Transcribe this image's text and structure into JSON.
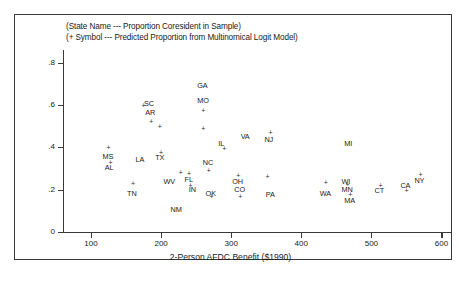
{
  "figure": {
    "caption_line1": "(State Name --- Proportion Coresident in Sample)",
    "caption_line2": "(+ Symbol --- Predicted Proportion from Multinomical Logit Model)"
  },
  "chart_data": {
    "type": "scatter",
    "title": "",
    "xlabel": "2-Person AFDC Benefit ($1990)",
    "ylabel": "",
    "xlim": [
      60,
      615
    ],
    "ylim": [
      0,
      0.86
    ],
    "grid": false,
    "legend": "none",
    "xticks": [
      100,
      200,
      300,
      400,
      500,
      600
    ],
    "xtick_labels": [
      "100",
      "200",
      "300",
      "400",
      "500",
      "600"
    ],
    "yticks": [
      0,
      0.2,
      0.4,
      0.6,
      0.8
    ],
    "ytick_labels": [
      "0",
      ".2",
      ".4",
      ".6",
      ".8"
    ],
    "series": [
      {
        "name": "Proportion Coresident in Sample",
        "marker": "state-name-label",
        "points": [
          {
            "label": "GA",
            "x": 260,
            "y": 0.695
          },
          {
            "label": "MO",
            "x": 260,
            "y": 0.625
          },
          {
            "label": "SC",
            "x": 184,
            "y": 0.61
          },
          {
            "label": "AR",
            "x": 186,
            "y": 0.565
          },
          {
            "label": "VA",
            "x": 322,
            "y": 0.455
          },
          {
            "label": "NJ",
            "x": 356,
            "y": 0.44
          },
          {
            "label": "IL",
            "x": 290,
            "y": 0.42
          },
          {
            "label": "MI",
            "x": 470,
            "y": 0.42
          },
          {
            "label": "MS",
            "x": 125,
            "y": 0.36
          },
          {
            "label": "AL",
            "x": 128,
            "y": 0.305
          },
          {
            "label": "TX",
            "x": 200,
            "y": 0.355
          },
          {
            "label": "LA",
            "x": 172,
            "y": 0.345
          },
          {
            "label": "NC",
            "x": 268,
            "y": 0.33
          },
          {
            "label": "FL",
            "x": 242,
            "y": 0.252
          },
          {
            "label": "WV",
            "x": 212,
            "y": 0.24
          },
          {
            "label": "IN",
            "x": 248,
            "y": 0.205
          },
          {
            "label": "OH",
            "x": 310,
            "y": 0.242
          },
          {
            "label": "CO",
            "x": 313,
            "y": 0.205
          },
          {
            "label": "OK",
            "x": 272,
            "y": 0.185
          },
          {
            "label": "TN",
            "x": 160,
            "y": 0.185
          },
          {
            "label": "NM",
            "x": 222,
            "y": 0.11
          },
          {
            "label": "PA",
            "x": 358,
            "y": 0.18
          },
          {
            "label": "WA",
            "x": 435,
            "y": 0.185
          },
          {
            "label": "WI",
            "x": 466,
            "y": 0.24
          },
          {
            "label": "MN",
            "x": 466,
            "y": 0.205
          },
          {
            "label": "MA",
            "x": 470,
            "y": 0.15
          },
          {
            "label": "CT",
            "x": 513,
            "y": 0.2
          },
          {
            "label": "CA",
            "x": 550,
            "y": 0.222
          },
          {
            "label": "NY",
            "x": 570,
            "y": 0.245
          }
        ]
      },
      {
        "name": "Predicted Proportion from Multinomical Logit Model",
        "marker": "plus",
        "points": [
          {
            "x": 175,
            "y": 0.6
          },
          {
            "x": 260,
            "y": 0.575
          },
          {
            "x": 186,
            "y": 0.52
          },
          {
            "x": 198,
            "y": 0.5
          },
          {
            "x": 260,
            "y": 0.49
          },
          {
            "x": 356,
            "y": 0.47
          },
          {
            "x": 290,
            "y": 0.395
          },
          {
            "x": 125,
            "y": 0.4
          },
          {
            "x": 128,
            "y": 0.33
          },
          {
            "x": 200,
            "y": 0.375
          },
          {
            "x": 268,
            "y": 0.29
          },
          {
            "x": 228,
            "y": 0.282
          },
          {
            "x": 240,
            "y": 0.278
          },
          {
            "x": 310,
            "y": 0.268
          },
          {
            "x": 352,
            "y": 0.262
          },
          {
            "x": 242,
            "y": 0.222
          },
          {
            "x": 160,
            "y": 0.228
          },
          {
            "x": 272,
            "y": 0.168
          },
          {
            "x": 313,
            "y": 0.17
          },
          {
            "x": 435,
            "y": 0.232
          },
          {
            "x": 466,
            "y": 0.225
          },
          {
            "x": 470,
            "y": 0.178
          },
          {
            "x": 513,
            "y": 0.222
          },
          {
            "x": 550,
            "y": 0.198
          },
          {
            "x": 570,
            "y": 0.272
          }
        ]
      }
    ]
  }
}
